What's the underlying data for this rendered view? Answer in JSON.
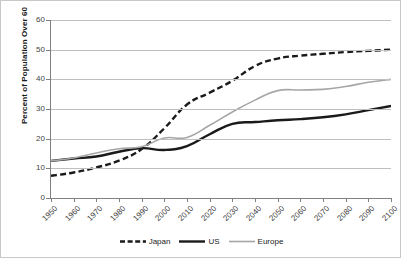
{
  "chart_data": {
    "type": "line",
    "title": "",
    "xlabel": "",
    "ylabel": "Percent of Population Over 60",
    "xlim": [
      1950,
      2100
    ],
    "ylim": [
      0,
      60
    ],
    "ytick_step": 10,
    "grid": true,
    "legend_position": "bottom",
    "x": [
      1950,
      1960,
      1970,
      1980,
      1990,
      2000,
      2010,
      2020,
      2030,
      2040,
      2050,
      2060,
      2070,
      2080,
      2090,
      2100
    ],
    "categories": [
      "1950",
      "1960",
      "1970",
      "1980",
      "1990",
      "2000",
      "2010",
      "2020",
      "2030",
      "2040",
      "2050",
      "2060",
      "2070",
      "2080",
      "2090",
      "2100"
    ],
    "yticks": [
      "0",
      "10",
      "20",
      "30",
      "40",
      "50",
      "60"
    ],
    "series": [
      {
        "name": "Japan",
        "color": "#1a1a1a",
        "style": "dashed",
        "width": 2.4,
        "values": [
          7.5,
          8.6,
          10.3,
          12.6,
          16.5,
          23.5,
          31.5,
          35.5,
          39.5,
          44.5,
          47.0,
          48.0,
          48.6,
          49.2,
          49.6,
          50.0
        ]
      },
      {
        "name": "US",
        "color": "#1a1a1a",
        "style": "solid",
        "width": 2.4,
        "values": [
          12.5,
          13.3,
          14.0,
          15.6,
          16.8,
          16.2,
          17.5,
          21.5,
          25.0,
          25.6,
          26.2,
          26.6,
          27.2,
          28.2,
          29.6,
          31.0
        ]
      },
      {
        "name": "Europe",
        "color": "#a6a6a6",
        "style": "solid",
        "width": 1.6,
        "values": [
          12.5,
          13.5,
          15.2,
          16.6,
          17.3,
          20.2,
          20.4,
          24.5,
          29.0,
          33.0,
          36.2,
          36.4,
          36.6,
          37.6,
          39.0,
          40.0
        ]
      }
    ]
  },
  "legend": {
    "items": [
      {
        "label": "Japan"
      },
      {
        "label": "US"
      },
      {
        "label": "Europe"
      }
    ]
  }
}
